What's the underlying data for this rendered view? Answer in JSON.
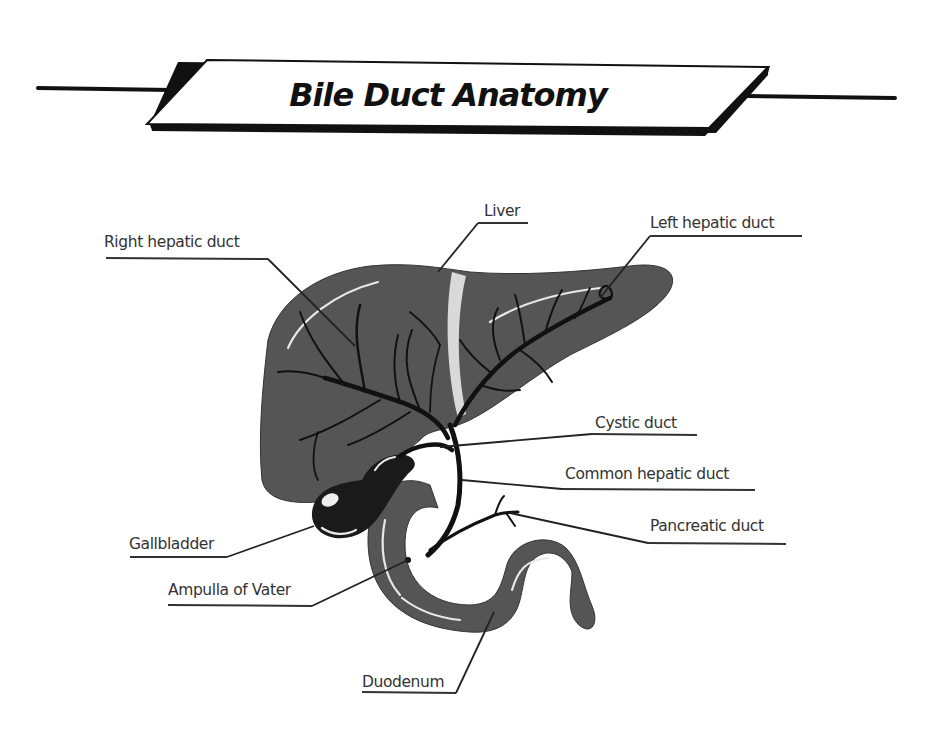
{
  "title": "Bile Duct Anatomy",
  "colors": {
    "organ_fill": "#555555",
    "organ_dark": "#444444",
    "gallbladder_fill": "#1a1a1a",
    "duct_stroke": "#111111",
    "ligament": "#d9d9d9",
    "label_text": "#333333",
    "title_text": "#111111",
    "background": "#ffffff"
  },
  "labels": {
    "right_hepatic_duct": "Right hepatic duct",
    "liver": "Liver",
    "left_hepatic_duct": "Left hepatic duct",
    "cystic_duct": "Cystic duct",
    "common_hepatic_duct": "Common hepatic duct",
    "pancreatic_duct": "Pancreatic duct",
    "gallbladder": "Gallbladder",
    "ampulla_of_vater": "Ampulla of Vater",
    "duodenum": "Duodenum"
  }
}
